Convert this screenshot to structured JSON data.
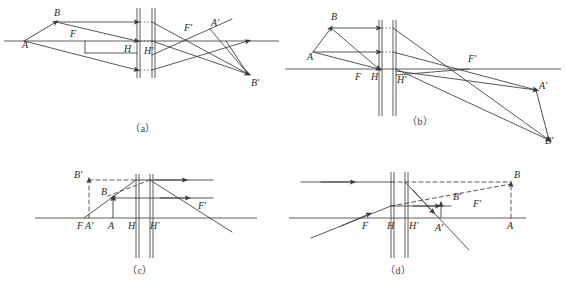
{
  "sheet": {
    "title": "Thick lens / principal plane ray-tracing diagrams",
    "width": 565,
    "height": 291,
    "background": "#ffffff",
    "ink_color": "#3a3a3a",
    "axis_color": "#4d4d4d"
  },
  "panels": [
    {
      "id": "a",
      "caption": "（a）",
      "description": "Real object outside focus, converging thick lens, real inverted image",
      "labels": [
        {
          "name": "A",
          "text": "A",
          "x": 22,
          "y": 48
        },
        {
          "name": "B",
          "text": "B",
          "x": 57,
          "y": 16
        },
        {
          "name": "F",
          "text": "F",
          "x": 72,
          "y": 36
        },
        {
          "name": "H",
          "text": "H",
          "x": 126,
          "y": 52
        },
        {
          "name": "Hp",
          "text": "H′",
          "x": 146,
          "y": 54
        },
        {
          "name": "Fp",
          "text": "F′",
          "x": 186,
          "y": 31
        },
        {
          "name": "Ap",
          "text": "A′",
          "x": 213,
          "y": 26
        },
        {
          "name": "Bp",
          "text": "B′",
          "x": 253,
          "y": 82
        }
      ]
    },
    {
      "id": "b",
      "caption": "（b）",
      "description": "Object at/near front principal plane, strongly converging system, distant real image",
      "labels": [
        {
          "name": "B",
          "text": "B",
          "x": 333,
          "y": 20
        },
        {
          "name": "A",
          "text": "A",
          "x": 310,
          "y": 58
        },
        {
          "name": "F",
          "text": "F",
          "x": 357,
          "y": 79
        },
        {
          "name": "H",
          "text": "H",
          "x": 398,
          "y": 79
        },
        {
          "name": "Hp",
          "text": "H′",
          "x": 418,
          "y": 82
        },
        {
          "name": "Fp",
          "text": "F′",
          "x": 470,
          "y": 63
        },
        {
          "name": "Ap",
          "text": "A′",
          "x": 538,
          "y": 89
        },
        {
          "name": "Bp",
          "text": "B′",
          "x": 544,
          "y": 133
        }
      ]
    },
    {
      "id": "c",
      "caption": "（c）",
      "description": "Object inside front focal length, virtual upright magnified image",
      "labels": [
        {
          "name": "Bp",
          "text": "B′",
          "x": 76,
          "y": 175
        },
        {
          "name": "B",
          "text": "B",
          "x": 103,
          "y": 192
        },
        {
          "name": "F",
          "text": "F",
          "x": 79,
          "y": 224
        },
        {
          "name": "Ap",
          "text": "A′",
          "x": 87,
          "y": 224
        },
        {
          "name": "A",
          "text": "A",
          "x": 108,
          "y": 224
        },
        {
          "name": "H",
          "text": "H",
          "x": 131,
          "y": 224
        },
        {
          "name": "Hp",
          "text": "H′",
          "x": 153,
          "y": 224
        },
        {
          "name": "Fp",
          "text": "F′",
          "x": 201,
          "y": 205
        }
      ]
    },
    {
      "id": "d",
      "caption": "（d）",
      "description": "Virtual object behind the lens, diverging arrangement, reduced virtual image",
      "labels": [
        {
          "name": "B",
          "text": "B",
          "x": 511,
          "y": 176
        },
        {
          "name": "Bp",
          "text": "B′",
          "x": 455,
          "y": 196
        },
        {
          "name": "Fp",
          "text": "F′",
          "x": 475,
          "y": 203
        },
        {
          "name": "F",
          "text": "F",
          "x": 364,
          "y": 222
        },
        {
          "name": "H",
          "text": "H",
          "x": 390,
          "y": 222
        },
        {
          "name": "Hp",
          "text": "H′",
          "x": 412,
          "y": 222
        },
        {
          "name": "Ap",
          "text": "A′",
          "x": 438,
          "y": 224
        },
        {
          "name": "A",
          "text": "A",
          "x": 506,
          "y": 222
        }
      ]
    }
  ]
}
